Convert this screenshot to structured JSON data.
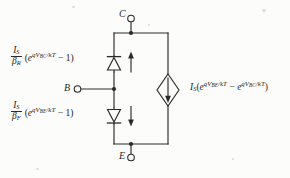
{
  "figure": {
    "kind": "ebers-moll-transistor-equivalent-circuit",
    "background_color": "#fcfcfb",
    "line_color": "#2a2a2a",
    "text_color": "#232323"
  },
  "terminals": [
    {
      "id": "collector",
      "label": "C",
      "position": "top"
    },
    {
      "id": "base",
      "label": "B",
      "position": "left"
    },
    {
      "id": "emitter",
      "label": "E",
      "position": "bottom"
    }
  ],
  "equations": {
    "reverse_diode": {
      "numerator": "I",
      "numerator_sub": "S",
      "denominator": "β",
      "denominator_sub": "R",
      "open_paren": "(",
      "exp_base": "e",
      "exp_prefix": "qV",
      "exp_sub": "BC",
      "exp_suffix": "/kT",
      "minus_one": " − 1)"
    },
    "forward_diode": {
      "numerator": "I",
      "numerator_sub": "S",
      "denominator": "β",
      "denominator_sub": "F",
      "open_paren": "(",
      "exp_base": "e",
      "exp_prefix": "qV",
      "exp_sub": "BE",
      "exp_suffix": "/kT",
      "minus_one": " − 1)"
    },
    "current_source": {
      "coefficient": "I",
      "coefficient_sub": "S",
      "open_paren": "(",
      "exp1_base": "e",
      "exp1_prefix": "qV",
      "exp1_sub": "BE",
      "exp1_suffix": "/kT",
      "minus": " − ",
      "exp2_base": "e",
      "exp2_prefix": "qV",
      "exp2_sub": "BC",
      "exp2_suffix": "/kT",
      "close_paren": ")"
    }
  },
  "components": [
    {
      "id": "reverse-diode",
      "type": "diode",
      "direction": "up",
      "branch": "base-collector",
      "arrow_label_direction": "up"
    },
    {
      "id": "forward-diode",
      "type": "diode",
      "direction": "down",
      "branch": "base-emitter",
      "arrow_label_direction": "down"
    },
    {
      "id": "transport-current-source",
      "type": "dependent-current-source",
      "shape": "diamond",
      "arrow_direction": "down",
      "branch": "collector-emitter"
    }
  ],
  "nodes": [
    {
      "id": "collector-junction",
      "type": "junction-dot"
    },
    {
      "id": "base-junction",
      "type": "junction-dot"
    },
    {
      "id": "emitter-junction",
      "type": "junction-dot"
    }
  ]
}
